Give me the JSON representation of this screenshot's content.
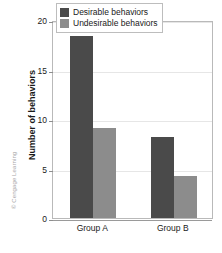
{
  "credit": "© Cengage Learning",
  "chart_data": {
    "type": "bar",
    "title": "",
    "xlabel": "",
    "ylabel": "Number of behaviors",
    "ylim": [
      0,
      20
    ],
    "yticks": [
      0,
      5,
      10,
      15,
      20
    ],
    "ytick_labels": [
      "0",
      "5",
      "10",
      "15",
      "20"
    ],
    "grid": true,
    "legend_position": "top-right-inside",
    "categories": [
      "Group A",
      "Group B"
    ],
    "series": [
      {
        "name": "Desirable behaviors",
        "color": "#4a4a4a",
        "values": [
          18.4,
          8.2
        ]
      },
      {
        "name": "Undesirable behaviors",
        "color": "#8c8c8c",
        "values": [
          9.1,
          4.2
        ]
      }
    ]
  }
}
